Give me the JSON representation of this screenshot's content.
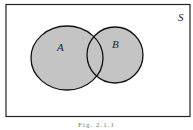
{
  "diagram": {
    "type": "venn",
    "universe_label": "S",
    "sets": [
      {
        "label": "A",
        "cx": 67,
        "cy": 58,
        "rx": 36,
        "ry": 32
      },
      {
        "label": "B",
        "cx": 115,
        "cy": 55,
        "rx": 28,
        "ry": 28
      }
    ],
    "shaded_region": "A ∪ B",
    "colors": {
      "fill": "#c4c4c4",
      "stroke": "#111111",
      "background": "#ffffff"
    },
    "caption": "Fig. 2.1.1"
  }
}
